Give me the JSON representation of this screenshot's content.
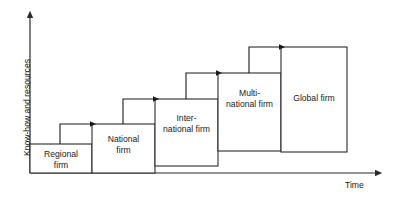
{
  "diagram": {
    "axes": {
      "y_label": "Know-how and resources",
      "x_label": "Time",
      "y_axis_color": "#2b2b2b",
      "x_axis_color": "#2b2b2b"
    },
    "stage_box_color": "#2b2b2b",
    "stage_fill": "#ffffff",
    "arrow_color": "#1a1a1a",
    "stages": [
      {
        "id": "regional-firm",
        "label": "Regional\nfirm",
        "x": 30,
        "y": 144,
        "width": 62,
        "height": 29,
        "label_cx": 61,
        "label_cy": 158
      },
      {
        "id": "national-firm",
        "label": "National\nfirm",
        "x": 92,
        "y": 124,
        "width": 63,
        "height": 49,
        "label_cx": 123.5,
        "label_cy": 143
      },
      {
        "id": "international-firm",
        "label": "Inter-\nnational firm",
        "x": 155,
        "y": 99,
        "width": 63,
        "height": 67,
        "label_cx": 186.5,
        "label_cy": 122
      },
      {
        "id": "multinational-firm",
        "label": "Multi-\nnational firm",
        "x": 218,
        "y": 73,
        "width": 63,
        "height": 78,
        "label_cx": 249.5,
        "label_cy": 97
      },
      {
        "id": "global-firm",
        "label": "Global firm",
        "x": 281,
        "y": 47,
        "width": 66,
        "height": 105,
        "label_cx": 314,
        "label_cy": 98
      }
    ],
    "transitions": [
      {
        "id": "arrow-regional-to-national",
        "from": "regional-firm",
        "to": "national-firm",
        "start_x": 60,
        "start_y": 144,
        "top_y": 124,
        "end_x": 97
      },
      {
        "id": "arrow-national-to-international",
        "from": "national-firm",
        "to": "international-firm",
        "start_x": 123,
        "start_y": 124,
        "top_y": 99,
        "end_x": 160
      },
      {
        "id": "arrow-international-to-multinational",
        "from": "international-firm",
        "to": "multinational-firm",
        "start_x": 186,
        "start_y": 99,
        "top_y": 73,
        "end_x": 223
      },
      {
        "id": "arrow-multinational-to-global",
        "from": "multinational-firm",
        "to": "global-firm",
        "start_x": 249,
        "start_y": 73,
        "top_y": 47,
        "end_x": 286
      }
    ]
  }
}
